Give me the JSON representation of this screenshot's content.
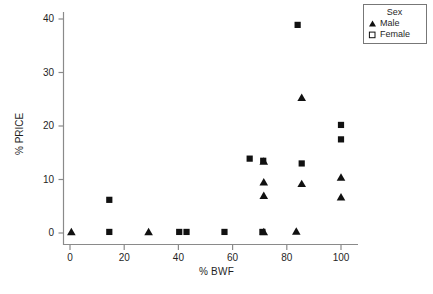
{
  "chart_data": {
    "type": "scatter",
    "title": "",
    "xlabel": "% BWF",
    "ylabel": "% PRICE",
    "xlim": [
      -4,
      108
    ],
    "ylim": [
      -2.5,
      41.5
    ],
    "xticks": [
      0,
      20,
      40,
      60,
      80,
      100
    ],
    "yticks": [
      0,
      10,
      20,
      30,
      40
    ],
    "xtick_labels": [
      "0",
      "20",
      "40",
      "60",
      "80",
      "100"
    ],
    "ytick_labels": [
      "0",
      "10",
      "20",
      "30",
      "40"
    ],
    "grid": false,
    "legend": {
      "title": "Sex",
      "position": "top-right",
      "entries": [
        {
          "label": "Male",
          "marker": "filled-triangle"
        },
        {
          "label": "Female",
          "marker": "open-square"
        }
      ]
    },
    "series": [
      {
        "name": "Male",
        "marker": "filled-triangle",
        "color": "#111111",
        "points": [
          {
            "x": 0.5,
            "y": 0.2
          },
          {
            "x": 29.0,
            "y": 0.2
          },
          {
            "x": 71.5,
            "y": 0.2
          },
          {
            "x": 83.5,
            "y": 0.3
          },
          {
            "x": 71.5,
            "y": 7.0
          },
          {
            "x": 71.5,
            "y": 9.5
          },
          {
            "x": 71.5,
            "y": 13.4
          },
          {
            "x": 85.5,
            "y": 9.2
          },
          {
            "x": 85.5,
            "y": 25.3
          },
          {
            "x": 100.0,
            "y": 6.7
          },
          {
            "x": 100.0,
            "y": 10.4
          }
        ]
      },
      {
        "name": "Female",
        "marker": "filled-square",
        "color": "#111111",
        "points": [
          {
            "x": 14.5,
            "y": 0.2
          },
          {
            "x": 14.5,
            "y": 6.2
          },
          {
            "x": 40.3,
            "y": 0.2
          },
          {
            "x": 43.0,
            "y": 0.2
          },
          {
            "x": 57.0,
            "y": 0.2
          },
          {
            "x": 71.0,
            "y": 0.2
          },
          {
            "x": 66.3,
            "y": 13.9
          },
          {
            "x": 71.3,
            "y": 13.5
          },
          {
            "x": 85.5,
            "y": 13.0
          },
          {
            "x": 84.0,
            "y": 38.9
          },
          {
            "x": 100.0,
            "y": 17.5
          },
          {
            "x": 100.0,
            "y": 20.2
          }
        ]
      }
    ]
  }
}
